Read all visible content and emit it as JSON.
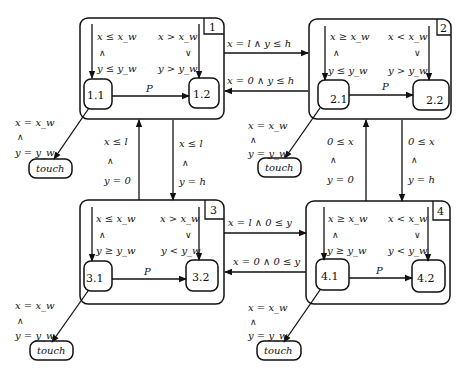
{
  "diagram": {
    "type": "hierarchical-state-machine",
    "superstates": [
      {
        "id": "1",
        "label": "1",
        "substates": [
          {
            "id": "1.1",
            "label": "1.1"
          },
          {
            "id": "1.2",
            "label": "1.2"
          }
        ],
        "init_left": {
          "top": "x ≤ x_w",
          "op": "∧",
          "bottom": "y ≤ y_w"
        },
        "init_right": {
          "top": "x > x_w",
          "op": "∨",
          "bottom": "y > y_w"
        },
        "transition_label": "P",
        "touch_guard": {
          "top": "x = x_w",
          "op": "∧",
          "bottom": "y = y_w"
        },
        "touch_label": "touch"
      },
      {
        "id": "2",
        "label": "2",
        "substates": [
          {
            "id": "2.1",
            "label": "2.1"
          },
          {
            "id": "2.2",
            "label": "2.2"
          }
        ],
        "init_left": {
          "top": "x ≥ x_w",
          "op": "∧",
          "bottom": "y ≤ y_w"
        },
        "init_right": {
          "top": "x < x_w",
          "op": "∨",
          "bottom": "y > y_w"
        },
        "transition_label": "P",
        "touch_guard": {
          "top": "x = x_w",
          "op": "∧",
          "bottom": "y = y_w"
        },
        "touch_label": "touch"
      },
      {
        "id": "3",
        "label": "3",
        "substates": [
          {
            "id": "3.1",
            "label": "3.1"
          },
          {
            "id": "3.2",
            "label": "3.2"
          }
        ],
        "init_left": {
          "top": "x ≤ x_w",
          "op": "∧",
          "bottom": "y ≥ y_w"
        },
        "init_right": {
          "top": "x > x_w",
          "op": "∨",
          "bottom": "y < y_w"
        },
        "transition_label": "P",
        "touch_guard": {
          "top": "x = x_w",
          "op": "∧",
          "bottom": "y = y_w"
        },
        "touch_label": "touch"
      },
      {
        "id": "4",
        "label": "4",
        "substates": [
          {
            "id": "4.1",
            "label": "4.1"
          },
          {
            "id": "4.2",
            "label": "4.2"
          }
        ],
        "init_left": {
          "top": "x ≥ x_w",
          "op": "∧",
          "bottom": "y ≥ y_w"
        },
        "init_right": {
          "top": "x < x_w",
          "op": "∨",
          "bottom": "y < y_w"
        },
        "transition_label": "P",
        "touch_guard": {
          "top": "x = x_w",
          "op": "∧",
          "bottom": "y = y_w"
        },
        "touch_label": "touch"
      }
    ],
    "inter_transitions": {
      "s1_to_s2": "x = l ∧ y ≤ h",
      "s2_to_s1": "x = 0 ∧ y ≤ h",
      "s3_to_s4": "x = l ∧ 0 ≤ y",
      "s4_to_s3": "x = 0 ∧ 0 ≤ y",
      "s3_to_s1": {
        "top": "x ≤ l",
        "op": "∧",
        "bottom": "y = 0"
      },
      "s1_to_s3": {
        "top": "x ≤ l",
        "op": "∧",
        "bottom": "y = h"
      },
      "s4_to_s2": {
        "top": "0 ≤ x",
        "op": "∧",
        "bottom": "y = 0"
      },
      "s2_to_s4": {
        "top": "0 ≤ x",
        "op": "∧",
        "bottom": "y = h"
      }
    }
  }
}
